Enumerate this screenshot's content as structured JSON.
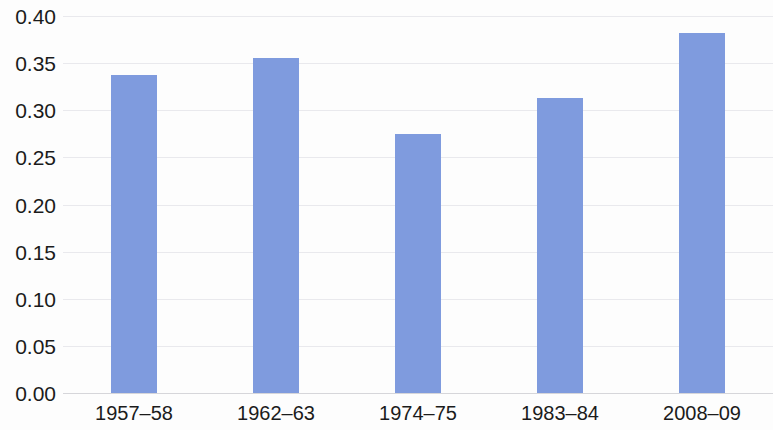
{
  "chart_data": {
    "type": "bar",
    "title": "",
    "subtitle": "",
    "xlabel": "",
    "ylabel": "",
    "categories": [
      "1957–58",
      "1962–63",
      "1974–75",
      "1983–84",
      "2008–09"
    ],
    "values": [
      0.337,
      0.355,
      0.275,
      0.313,
      0.382
    ],
    "series": [
      {
        "name": "",
        "values": [
          0.337,
          0.355,
          0.275,
          0.313,
          0.382
        ]
      }
    ],
    "ylim": [
      0.0,
      0.4
    ],
    "ytick_labels": [
      "0.00",
      "0.05",
      "0.10",
      "0.15",
      "0.20",
      "0.25",
      "0.30",
      "0.35",
      "0.40"
    ],
    "ytick_values": [
      0.0,
      0.05,
      0.1,
      0.15,
      0.2,
      0.25,
      0.3,
      0.35,
      0.4
    ],
    "grid": true,
    "grid_axis": "y",
    "legend": false,
    "legend_position": "none",
    "bar_color": "#7f9bde",
    "grid_color": "#e9e9ed",
    "axis_color": "#d6d6da",
    "background_color": "#fdfdfd",
    "text_color": "#1b1b1b"
  }
}
